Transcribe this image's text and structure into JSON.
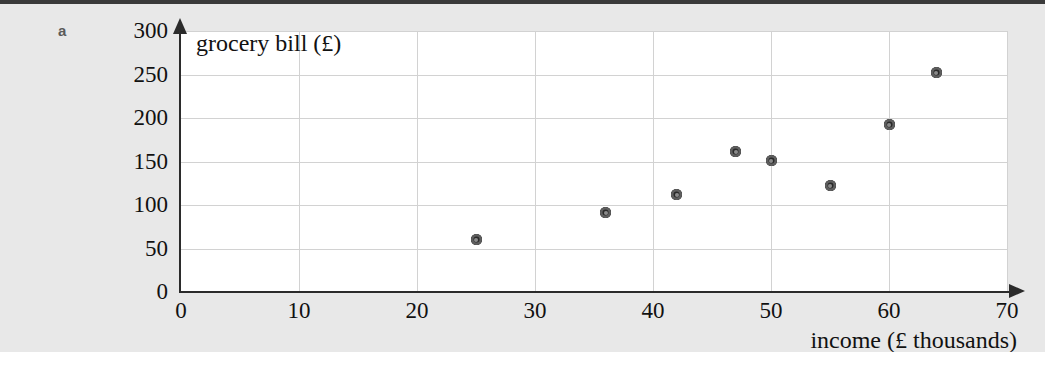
{
  "page": {
    "part_label": "a",
    "background_color": "#e8e8e8",
    "rule_color": "#3a3a3a"
  },
  "chart_data": {
    "type": "scatter",
    "title": "",
    "xlabel": "income (£ thousands)",
    "ylabel": "grocery bill (£)",
    "xlim": [
      0,
      70
    ],
    "ylim": [
      0,
      300
    ],
    "xticks": [
      "0",
      "10",
      "20",
      "30",
      "40",
      "50",
      "60",
      "70"
    ],
    "yticks": [
      "0",
      "50",
      "100",
      "150",
      "200",
      "250",
      "300"
    ],
    "xtick_values": [
      0,
      10,
      20,
      30,
      40,
      50,
      60,
      70
    ],
    "ytick_values": [
      0,
      50,
      100,
      150,
      200,
      250,
      300
    ],
    "grid": true,
    "legend": "none",
    "marker_color": "#3c3c3c",
    "x": [
      25,
      36,
      42,
      47,
      50,
      55,
      60,
      64
    ],
    "y": [
      60,
      91,
      112,
      161,
      151,
      122,
      192,
      252
    ],
    "points": [
      {
        "x": 25,
        "y": 60
      },
      {
        "x": 36,
        "y": 91
      },
      {
        "x": 42,
        "y": 112
      },
      {
        "x": 47,
        "y": 161
      },
      {
        "x": 50,
        "y": 151
      },
      {
        "x": 55,
        "y": 122
      },
      {
        "x": 60,
        "y": 192
      },
      {
        "x": 64,
        "y": 252
      }
    ]
  }
}
